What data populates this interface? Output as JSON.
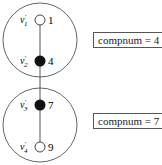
{
  "components": [
    {
      "compnum_label": "compnum = 4",
      "vertices": [
        {
          "name": "v'1",
          "label_main": "v",
          "label_sub": "1",
          "value": "1",
          "fill": "open"
        },
        {
          "name": "v'2",
          "label_main": "v",
          "label_sub": "2",
          "value": "4",
          "fill": "filled"
        }
      ]
    },
    {
      "compnum_label": "compnum = 7",
      "vertices": [
        {
          "name": "v'3",
          "label_main": "v",
          "label_sub": "3",
          "value": "7",
          "fill": "filled"
        },
        {
          "name": "v'4",
          "label_main": "v",
          "label_sub": "4",
          "value": "9",
          "fill": "open"
        }
      ]
    }
  ],
  "colors": {
    "stroke": "#555555",
    "filled_node": "#111111",
    "open_node": "#ffffff"
  }
}
